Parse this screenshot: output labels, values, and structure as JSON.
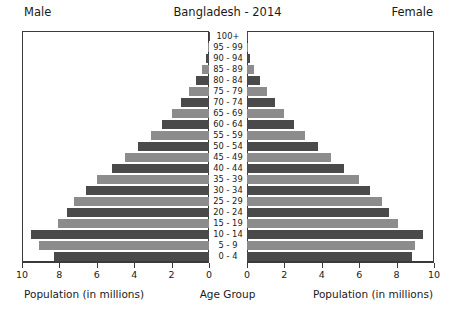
{
  "header": {
    "left_label": "Male",
    "title": "Bangladesh - 2014",
    "right_label": "Female"
  },
  "captions": {
    "left": "Population (in millions)",
    "center": "Age Group",
    "right": "Population (in millions)"
  },
  "axis": {
    "male_ticks": [
      "10",
      "8",
      "6",
      "4",
      "2",
      "0"
    ],
    "female_ticks": [
      "0",
      "2",
      "4",
      "6",
      "8",
      "10"
    ]
  },
  "colors": {
    "bar_dark": "#4a4a4a",
    "bar_light": "#8c8c8c",
    "frame": "#3a3a3a",
    "background": "#ffffff"
  },
  "chart_data": {
    "type": "bar",
    "title": "Bangladesh - 2014",
    "subtype": "population-pyramid",
    "xlabel": "Population (in millions)",
    "ylabel": "Age Group",
    "xlim": [
      0,
      10
    ],
    "grid": false,
    "legend": [
      "Male",
      "Female"
    ],
    "legend_position": "top-corners",
    "categories": [
      "100+",
      "95 - 99",
      "90 - 94",
      "85 - 89",
      "80 - 84",
      "75 - 79",
      "70 - 74",
      "65 - 69",
      "60 - 64",
      "55 - 59",
      "50 - 54",
      "45 - 49",
      "40 - 44",
      "35 - 39",
      "30 - 34",
      "25 - 29",
      "20 - 24",
      "15 - 19",
      "10 - 14",
      "5 - 9",
      "0 - 4"
    ],
    "series": [
      {
        "name": "Male",
        "values": [
          0.02,
          0.05,
          0.15,
          0.35,
          0.7,
          1.05,
          1.5,
          2.0,
          2.5,
          3.1,
          3.8,
          4.5,
          5.2,
          6.0,
          6.6,
          7.2,
          7.6,
          8.1,
          9.5,
          9.1,
          8.3
        ]
      },
      {
        "name": "Female",
        "values": [
          0.02,
          0.05,
          0.15,
          0.35,
          0.7,
          1.05,
          1.5,
          2.0,
          2.5,
          3.1,
          3.8,
          4.5,
          5.2,
          6.0,
          6.6,
          7.2,
          7.6,
          8.1,
          9.4,
          9.0,
          8.8
        ]
      }
    ]
  }
}
